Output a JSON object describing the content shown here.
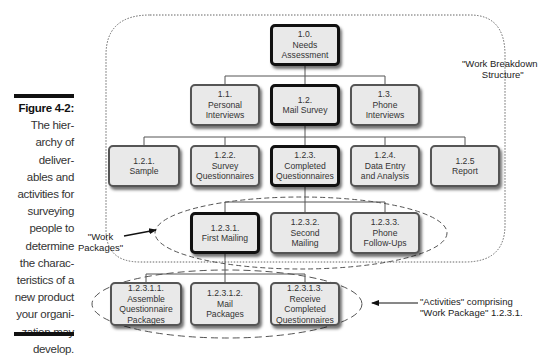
{
  "caption": {
    "figure_label": "Figure 4-2:",
    "lines": [
      "The hier-",
      "archy of",
      "deliver-",
      "ables and",
      "activities for",
      "surveying",
      "people to",
      "determine",
      "the charac-",
      "teristics of a",
      "new product",
      "your organi-",
      "zation may",
      "develop."
    ]
  },
  "annotations": {
    "wbs": [
      "\"Work Breakdown",
      "Structure\""
    ],
    "work_packages": [
      "\"Work",
      "Packages\""
    ],
    "activities": [
      "\"Activities\" comprising",
      "\"Work Package\" 1.2.3.1."
    ]
  },
  "nodes": {
    "n1_0": {
      "num": "1.0.",
      "lines": [
        "Needs",
        "Assessment"
      ]
    },
    "n1_1": {
      "num": "1.1.",
      "lines": [
        "Personal",
        "Interviews"
      ]
    },
    "n1_2": {
      "num": "1.2.",
      "lines": [
        "Mail Survey"
      ]
    },
    "n1_3": {
      "num": "1.3.",
      "lines": [
        "Phone",
        "Interviews"
      ]
    },
    "n1_2_1": {
      "num": "1.2.1.",
      "lines": [
        "Sample"
      ]
    },
    "n1_2_2": {
      "num": "1.2.2.",
      "lines": [
        "Survey",
        "Questionnaires"
      ]
    },
    "n1_2_3": {
      "num": "1.2.3.",
      "lines": [
        "Completed",
        "Questionnaires"
      ]
    },
    "n1_2_4": {
      "num": "1.2.4.",
      "lines": [
        "Data Entry",
        "and Analysis"
      ]
    },
    "n1_2_5": {
      "num": "1.2.5",
      "lines": [
        "Report"
      ]
    },
    "n1_2_3_1": {
      "num": "1.2.3.1.",
      "lines": [
        "First Mailing"
      ]
    },
    "n1_2_3_2": {
      "num": "1.2.3.2.",
      "lines": [
        "Second",
        "Mailing"
      ]
    },
    "n1_2_3_3": {
      "num": "1.2.3.3.",
      "lines": [
        "Phone",
        "Follow-Ups"
      ]
    },
    "n1_2_3_1_1": {
      "num": "1.2.3.1.1.",
      "lines": [
        "Assemble",
        "Questionnaire",
        "Packages"
      ]
    },
    "n1_2_3_1_2": {
      "num": "1.2.3.1.2.",
      "lines": [
        "Mail",
        "Packages"
      ]
    },
    "n1_2_3_1_3": {
      "num": "1.2.3.1.3.",
      "lines": [
        "Receive",
        "Completed",
        "Questionnaires"
      ]
    }
  }
}
